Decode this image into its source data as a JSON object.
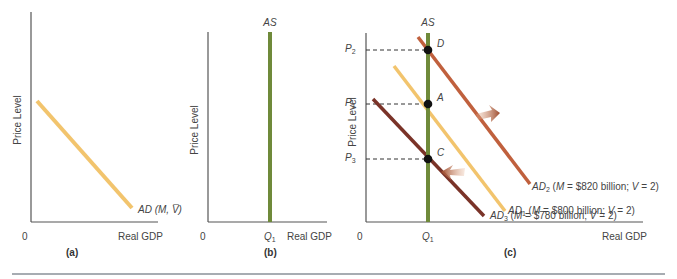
{
  "figure": {
    "panels": [
      {
        "id": "a",
        "caption": "(a)",
        "y_axis_label": "Price Level",
        "x_axis_label": "Real GDP",
        "origin_label": "0",
        "curves": [
          {
            "name": "AD",
            "label_main": "AD",
            "label_rest": " (M, V̅)",
            "color": "#f2c46d"
          }
        ]
      },
      {
        "id": "b",
        "caption": "(b)",
        "y_axis_label": "Price Level",
        "x_axis_label": "Real GDP",
        "origin_label": "0",
        "curves": [
          {
            "name": "AS",
            "label_main": "AS",
            "color": "#6f8a3a"
          }
        ],
        "x_ticks": [
          {
            "base": "Q",
            "sub": "1"
          }
        ]
      },
      {
        "id": "c",
        "caption": "(c)",
        "y_axis_label": "Price Level",
        "x_axis_label": "Real GDP",
        "origin_label": "0",
        "as_label": "AS",
        "x_ticks": [
          {
            "base": "Q",
            "sub": "1"
          }
        ],
        "y_ticks": [
          {
            "base": "P",
            "sub": "2"
          },
          {
            "base": "P",
            "sub": "1"
          },
          {
            "base": "P",
            "sub": "3"
          }
        ],
        "points": [
          {
            "label": "D"
          },
          {
            "label": "A"
          },
          {
            "label": "C"
          }
        ],
        "curves": [
          {
            "name": "AD2",
            "base": "AD",
            "sub": "2",
            "text": " (M = $820 billion; V = 2)",
            "m_prefix": "M",
            "m_value": " = $820 billion; ",
            "v_prefix": "V",
            "v_value": " = 2)",
            "color": "#c0603d"
          },
          {
            "name": "AD1",
            "base": "AD",
            "sub": "1",
            "text": " (M = $800 billion; V = 2)",
            "m_prefix": "M",
            "m_value": " = $800 billion; ",
            "v_prefix": "V",
            "v_value": " = 2)",
            "color": "#f2c46d"
          },
          {
            "name": "AD3",
            "base": "AD",
            "sub": "3",
            "text": " (M = $780 billion; V = 2)",
            "m_prefix": "M",
            "m_value": " = $780 billion; ",
            "v_prefix": "V",
            "v_value": " = 2)",
            "color": "#7a3328"
          }
        ],
        "shift_arrows": [
          {
            "direction": "right",
            "meaning": "AD1 to AD2"
          },
          {
            "direction": "left",
            "meaning": "AD1 to AD3"
          }
        ]
      }
    ],
    "colors": {
      "axis": "#555555",
      "as_green": "#6f8a3a",
      "ad_yellow": "#f2c46d",
      "ad2_rust": "#c0603d",
      "ad3_maroon": "#7a3328",
      "arrow": "#a45a3a",
      "rule": "#8a9098"
    }
  }
}
